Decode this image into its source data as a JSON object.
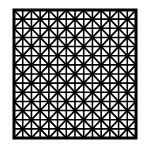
{
  "figure": {
    "title": "",
    "colors": {
      "background": "#ffffff",
      "stroke": "#000000"
    },
    "grid": {
      "cols": 7,
      "rows": 7,
      "x": 14,
      "y": 10,
      "width": 122,
      "height": 128,
      "border_width": 3,
      "line_width": 1.6,
      "diagonal_width": 1.8,
      "include_diagonals": true,
      "include_midlines": true
    }
  }
}
